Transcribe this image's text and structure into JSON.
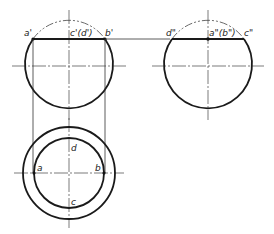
{
  "diagram": {
    "type": "orthographic-projection",
    "views": {
      "front": {
        "labels": {
          "a": "a'",
          "cd": "c'(d')",
          "b": "b'"
        }
      },
      "side": {
        "labels": {
          "d": "d\"",
          "ab": "a\"(b\")",
          "c": "c\""
        }
      },
      "top": {
        "labels": {
          "a": "a",
          "b": "b",
          "c": "c",
          "d": "d"
        }
      }
    },
    "colors": {
      "line": "#1a1a1a",
      "background": "#ffffff"
    }
  }
}
